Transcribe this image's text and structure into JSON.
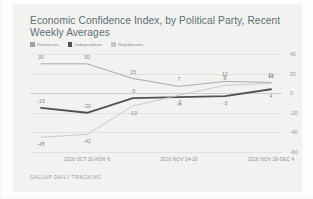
{
  "card": {
    "title": "Economic Confidence Index, by Political Party, Recent Weekly Averages",
    "source": "GALLUP DAILY TRACKING"
  },
  "colors": {
    "democrats": "#9aa4ab",
    "independents": "#4b5358",
    "republicans": "#c2c7ca",
    "grid": "#e2e2df",
    "zero": "#cfcfcb",
    "text": "#7d878e",
    "card_bg": "#f2f2f0"
  },
  "chart_data": {
    "type": "line",
    "title": "Economic Confidence Index, by Political Party, Recent Weekly Averages",
    "xlabel": "",
    "ylabel": "",
    "ylim": [
      -60,
      40
    ],
    "yticks": [
      40,
      20,
      0,
      -20,
      -40,
      -60
    ],
    "ytick_labels": [
      "40",
      "20",
      "0",
      "-20",
      "-40",
      "-60"
    ],
    "grid": true,
    "legend_position": "top-left",
    "x": [
      "2016 OCT 24-30",
      "2016 OCT 31-NOV 6",
      "2016 NOV 7-13",
      "2016 NOV 14-20",
      "2016 NOV 21-27",
      "2016 NOV 28-DEC 4"
    ],
    "xtick_labels": [
      "2016 OCT 31-NOV 6",
      "2016 NOV 14-20",
      "2016 NOV 28-DEC 4"
    ],
    "xtick_indices": [
      1,
      3,
      5
    ],
    "series": [
      {
        "name": "Democrats",
        "color": "#9aa4ab",
        "values": [
          30,
          30,
          15,
          7,
          12,
          11
        ],
        "labels": [
          "30",
          "30",
          "15",
          "7",
          "12",
          "11"
        ]
      },
      {
        "name": "Independents",
        "color": "#4b5358",
        "values": [
          -15,
          -20,
          -5,
          -4,
          -3,
          4
        ],
        "labels": [
          "-15",
          "-20",
          "-5",
          "-4",
          "-3",
          "4"
        ]
      },
      {
        "name": "Republicans",
        "color": "#c2c7ca",
        "values": [
          -45,
          -42,
          -13,
          -2,
          8,
          10
        ],
        "labels": [
          "-45",
          "-42",
          "-13",
          "-2",
          "8",
          "10"
        ]
      }
    ]
  }
}
